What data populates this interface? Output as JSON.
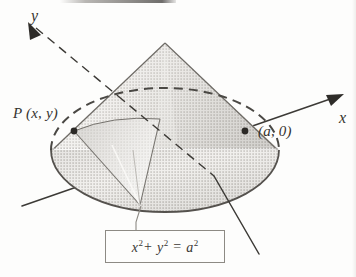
{
  "figure": {
    "background_color": "#fdfdfc",
    "ink_color": "#3a3834",
    "shading_light": "#e6e4e0",
    "shading_mid": "#c9c6c1",
    "shading_dark": "#a9a6a1"
  },
  "axes": {
    "y_label": "y",
    "x_label": "x",
    "y_axis_name": "y-axis",
    "x_axis_name": "x-axis"
  },
  "points": [
    {
      "id": "P",
      "label": "P (x, y)",
      "marker": "filled-dot"
    },
    {
      "id": "a",
      "label": "(a, 0)",
      "marker": "filled-dot"
    }
  ],
  "callout": {
    "equation_plain": "x2 + y2 = a2",
    "terms": {
      "x_base": "x",
      "x_exp": "2",
      "plus": "+",
      "y_base": "y",
      "y_exp": "2",
      "equals": "=",
      "a_base": "a",
      "a_exp": "2"
    }
  },
  "annotations": {
    "scan_artifact": "dark scan bar at top edge"
  }
}
